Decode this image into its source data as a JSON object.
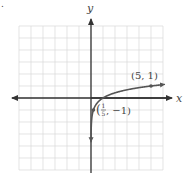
{
  "figure": {
    "corner_mark": ".",
    "x_axis_label": "x",
    "y_axis_label": "y",
    "grid": {
      "x_min": -6,
      "x_max": 6,
      "y_min": -6,
      "y_max": 6,
      "step": 1
    },
    "colors": {
      "grid": "#d9d9d9",
      "axis": "#333333",
      "curve": "#555555",
      "text": "#444444"
    },
    "curve": {
      "function": "y = log_5(x)",
      "asymptote": "x = 0"
    },
    "points": [
      {
        "x": 5,
        "y": 1,
        "label": "(5, 1)"
      },
      {
        "x": 0.2,
        "y": -1,
        "label_open": "(",
        "label_num": "1",
        "label_den": "5",
        "label_rest": ", −1)"
      }
    ]
  },
  "chart_data": {
    "type": "line",
    "title": "",
    "xlabel": "x",
    "ylabel": "y",
    "xlim": [
      -6,
      6
    ],
    "ylim": [
      -6,
      6
    ],
    "grid": true,
    "series": [
      {
        "name": "y = log_5(x)",
        "x": [
          0.01,
          0.05,
          0.2,
          0.5,
          1,
          2,
          3,
          4,
          5,
          6
        ],
        "values": [
          -2.86,
          -1.86,
          -1,
          -0.43,
          0,
          0.43,
          0.68,
          0.86,
          1,
          1.11
        ]
      }
    ],
    "annotations": [
      {
        "x": 5,
        "y": 1,
        "text": "(5, 1)"
      },
      {
        "x": 0.2,
        "y": -1,
        "text": "(1/5, −1)"
      }
    ]
  }
}
